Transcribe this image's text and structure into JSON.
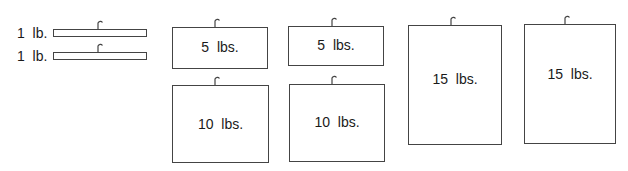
{
  "diagram": {
    "small_weights": [
      {
        "label": "1  lb.",
        "value": 1,
        "unit": "lb."
      },
      {
        "label": "1  lb.",
        "value": 1,
        "unit": "lb."
      }
    ],
    "weights": [
      {
        "label": "5  lbs.",
        "value": 5,
        "unit": "lbs."
      },
      {
        "label": "10  lbs.",
        "value": 10,
        "unit": "lbs."
      },
      {
        "label": "5  lbs.",
        "value": 5,
        "unit": "lbs."
      },
      {
        "label": "10  lbs.",
        "value": 10,
        "unit": "lbs."
      },
      {
        "label": "15  lbs.",
        "value": 15,
        "unit": "lbs."
      },
      {
        "label": "15  lbs.",
        "value": 15,
        "unit": "lbs."
      }
    ],
    "colors": {
      "stroke": "#444444",
      "text": "#1a1a1a",
      "background": "#ffffff"
    }
  }
}
